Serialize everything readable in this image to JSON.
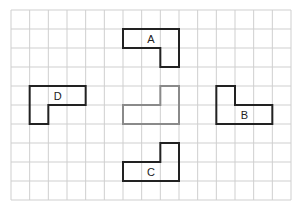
{
  "grid": {
    "columns": 15,
    "rows": 10,
    "line_color": "#cfcfcf"
  },
  "shapes": [
    {
      "id": "A",
      "label": "A",
      "color": "#222222",
      "cells": [
        [
          6,
          1
        ],
        [
          7,
          1
        ],
        [
          8,
          1
        ],
        [
          8,
          2
        ]
      ],
      "label_cell": [
        7,
        1
      ]
    },
    {
      "id": "original",
      "label": "",
      "color": "#8a8a8a",
      "cells": [
        [
          8,
          4
        ],
        [
          6,
          5
        ],
        [
          7,
          5
        ],
        [
          8,
          5
        ]
      ],
      "label_cell": null
    },
    {
      "id": "D",
      "label": "D",
      "color": "#222222",
      "cells": [
        [
          1,
          4
        ],
        [
          2,
          4
        ],
        [
          3,
          4
        ],
        [
          1,
          5
        ]
      ],
      "label_cell": [
        2,
        4
      ]
    },
    {
      "id": "B",
      "label": "B",
      "color": "#222222",
      "cells": [
        [
          11,
          4
        ],
        [
          11,
          5
        ],
        [
          12,
          5
        ],
        [
          13,
          5
        ]
      ],
      "label_cell": [
        12,
        5
      ]
    },
    {
      "id": "C",
      "label": "C",
      "color": "#222222",
      "cells": [
        [
          8,
          7
        ],
        [
          6,
          8
        ],
        [
          7,
          8
        ],
        [
          8,
          8
        ]
      ],
      "label_cell": [
        7,
        8
      ]
    }
  ]
}
